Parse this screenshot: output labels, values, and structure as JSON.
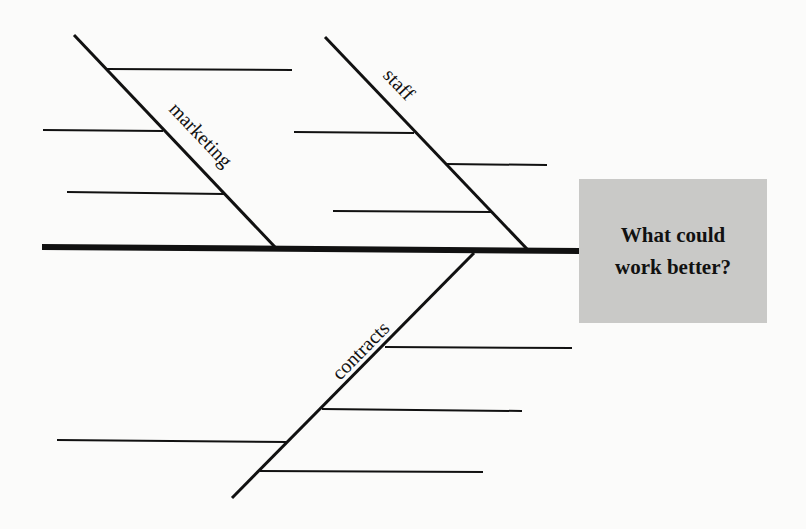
{
  "diagram": {
    "type": "fishbone",
    "head": {
      "line1": "What could",
      "line2": "work better?",
      "fill": "#c9c9c7"
    },
    "branches": [
      {
        "label": "marketing",
        "position": "top-left",
        "ribs": 3
      },
      {
        "label": "staff",
        "position": "top-right",
        "ribs": 3
      },
      {
        "label": "contracts",
        "position": "bottom",
        "ribs": 4
      }
    ],
    "line_color": "#111111"
  }
}
